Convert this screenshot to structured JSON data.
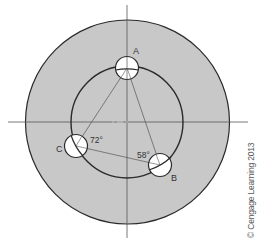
{
  "figure": {
    "colors": {
      "disk_fill": "#c8c8c8",
      "stroke": "#2a2a2a",
      "centerline": "#555555",
      "hole_fill": "#ffffff",
      "background": "#ffffff"
    },
    "holes": [
      {
        "id": "A",
        "label": "A"
      },
      {
        "id": "B",
        "label": "B"
      },
      {
        "id": "C",
        "label": "C"
      }
    ],
    "angles": [
      {
        "at": "C",
        "label": "72°"
      },
      {
        "at": "B",
        "label": "58°"
      }
    ],
    "copyright": "© Cengage Learning 2013"
  }
}
